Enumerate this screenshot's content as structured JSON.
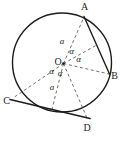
{
  "figure": {
    "name": "circle-tangent-chord-diagram",
    "background": "#ffffff",
    "line_color": "#1c1c1c",
    "dash_color": "#4a4a4a",
    "width": 129,
    "height": 145,
    "circle": {
      "cx": 62,
      "cy": 62.5,
      "r": 49.5
    },
    "center_point": {
      "label": "O",
      "dot_x": 63.5,
      "dot_y": 63.5,
      "dot_r": 1.3,
      "label_x": 58,
      "label_y": 64.5
    },
    "solid_segments": [
      {
        "name": "chord-AB",
        "x1": 84,
        "y1": 16.5,
        "x2": 109.5,
        "y2": 74,
        "w": 1.4
      },
      {
        "name": "tangent-line-CD",
        "x1": 10,
        "y1": 99.5,
        "x2": 90,
        "y2": 118.5,
        "w": 1.6
      }
    ],
    "dashed_segments": [
      {
        "name": "radius-OA-dashed",
        "x1": 63.5,
        "y1": 63.5,
        "x2": 84,
        "y2": 17
      },
      {
        "name": "apothem-OM-dashed",
        "x1": 63.5,
        "y1": 63.5,
        "x2": 96,
        "y2": 45.5
      },
      {
        "name": "radius-OB-dashed",
        "x1": 63.5,
        "y1": 63.5,
        "x2": 109,
        "y2": 74
      },
      {
        "name": "segment-OC-dashed",
        "x1": 63.5,
        "y1": 63.5,
        "x2": 13,
        "y2": 98
      },
      {
        "name": "radius-OE-tangent-dashed",
        "x1": 63.5,
        "y1": 63.5,
        "x2": 52,
        "y2": 109
      },
      {
        "name": "segment-OD-dashed",
        "x1": 63.5,
        "y1": 63.5,
        "x2": 87,
        "y2": 118
      }
    ],
    "point_labels": [
      {
        "name": "label-A",
        "text": "A",
        "x": 84.5,
        "y": 10
      },
      {
        "name": "label-B",
        "text": "B",
        "x": 114.5,
        "y": 78.5
      },
      {
        "name": "label-C",
        "text": "C",
        "x": 6.5,
        "y": 103.5
      },
      {
        "name": "label-D",
        "text": "D",
        "x": 87,
        "y": 131
      }
    ],
    "math_labels": [
      {
        "name": "radius-length-a-top",
        "text": "a",
        "x": 62,
        "y": 44
      },
      {
        "name": "radius-length-a-bottom",
        "text": "a",
        "x": 52,
        "y": 90
      },
      {
        "name": "angle-alpha-AOM",
        "text": "α",
        "x": 71.5,
        "y": 54
      },
      {
        "name": "angle-alpha-MOB",
        "text": "α",
        "x": 78.5,
        "y": 61.5
      },
      {
        "name": "angle-alpha-COE",
        "text": "α",
        "x": 51.5,
        "y": 74
      },
      {
        "name": "angle-alpha-EOD",
        "text": "α",
        "x": 60,
        "y": 75.5
      }
    ]
  }
}
